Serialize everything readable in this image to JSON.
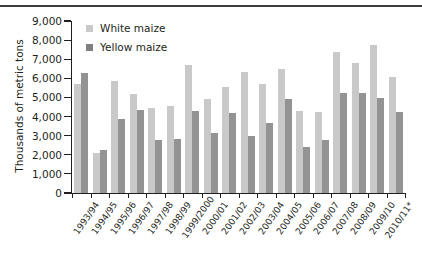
{
  "chart_data": {
    "type": "bar",
    "title": "",
    "subtitle": "",
    "xlabel": "",
    "ylabel": "Thousands of metric tons",
    "ylim": [
      0,
      9000
    ],
    "ytick_step": 1000,
    "ytick_labels": [
      "0",
      "1,000",
      "2,000",
      "3,000",
      "4,000",
      "5,000",
      "6,000",
      "7,000",
      "8,000",
      "9,000"
    ],
    "grid": false,
    "legend_position": "top-left",
    "categories": [
      "1993/94",
      "1994/95",
      "1995/96",
      "1996/97",
      "1997/98",
      "1998/99",
      "1999/2000",
      "2000/01",
      "2001/02",
      "2002/03",
      "2003/04",
      "2004/05",
      "2005/06",
      "2006/07",
      "2007/08",
      "2008/09",
      "2009/10",
      "2010/11*"
    ],
    "series": [
      {
        "name": "White maize",
        "color": "#c9c9c9",
        "values": [
          5700,
          2100,
          5850,
          5200,
          4450,
          4550,
          6700,
          4900,
          5550,
          6350,
          5700,
          6500,
          4300,
          4250,
          7400,
          6800,
          7750,
          6050
        ]
      },
      {
        "name": "Yellow maize",
        "color": "#939393",
        "values": [
          6300,
          2250,
          3850,
          4350,
          2750,
          2850,
          4300,
          3150,
          4200,
          3000,
          3650,
          4900,
          2400,
          2800,
          5250,
          5250,
          4950,
          4250
        ]
      }
    ],
    "footnote_marker": "*"
  },
  "legend": {
    "items": [
      {
        "label": "White maize",
        "swatch": "white-maize-swatch"
      },
      {
        "label": "Yellow maize",
        "swatch": "yellow-maize-swatch"
      }
    ]
  },
  "axes": {
    "y_title": "Thousands of metric tons"
  }
}
